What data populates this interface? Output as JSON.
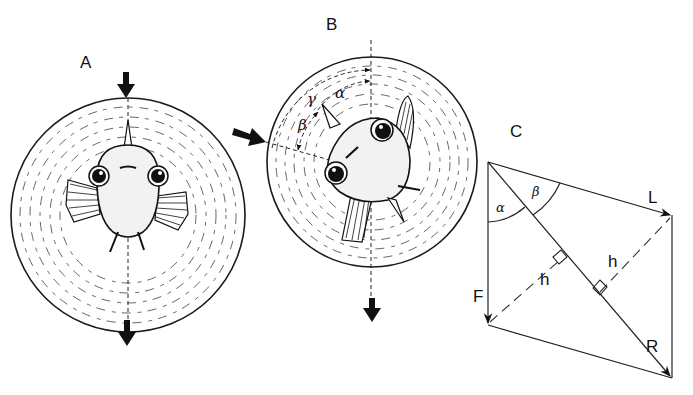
{
  "figure": {
    "panels": [
      {
        "id": "A",
        "label": "A",
        "description": "Fish viewed head-on inside circular ripple field; vertical force arrows top and bottom"
      },
      {
        "id": "B",
        "label": "B",
        "description": "Fish tilted inside circular ripple field; lateral arrow from left; angles marked",
        "angles": [
          "γ",
          "α",
          "β"
        ]
      },
      {
        "id": "C",
        "label": "C",
        "description": "Vector parallelogram of forces",
        "vectors": {
          "lateral": "L",
          "vertical": "F",
          "resultant": "R"
        },
        "angles": {
          "alpha": "α",
          "beta": "β"
        },
        "heights": [
          "h",
          "h"
        ]
      }
    ]
  },
  "labels": {
    "panel_a": "A",
    "panel_b": "B",
    "panel_c": "C",
    "gamma": "γ",
    "alpha": "α",
    "beta": "β",
    "vec_L": "L",
    "vec_F": "F",
    "vec_R": "R",
    "height_1": "h",
    "height_2": "h",
    "angle_alpha_c": "α",
    "angle_beta_c": "β"
  },
  "colors": {
    "ink": "#111111",
    "background": "#ffffff"
  }
}
